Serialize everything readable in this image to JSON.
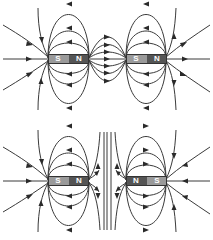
{
  "colors": {
    "line": "#3a3a3a",
    "south_pole": "#9a9a9a",
    "north_pole": "#555555",
    "label": "#ffffff",
    "background": "#ffffff"
  },
  "figures": [
    {
      "name": "attraction",
      "description": "Unlike poles facing (N to S) - field lines connect",
      "magnets": [
        {
          "x": 48,
          "y": 54,
          "w": 41,
          "left_label": "S",
          "right_label": "N"
        },
        {
          "x": 126,
          "y": 54,
          "w": 41,
          "left_label": "S",
          "right_label": "N"
        }
      ]
    },
    {
      "name": "repulsion",
      "description": "Like poles facing (N to N) - field lines repel",
      "magnets": [
        {
          "x": 48,
          "y": 176,
          "w": 41,
          "left_label": "S",
          "right_label": "N"
        },
        {
          "x": 126,
          "y": 176,
          "w": 41,
          "left_label": "N",
          "right_label": "S"
        }
      ]
    }
  ]
}
